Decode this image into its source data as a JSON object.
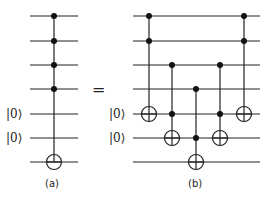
{
  "diagram": {
    "type": "quantum-circuit-identity",
    "equals_sign": "=",
    "left": {
      "caption": "(a)",
      "wires": [
        "",
        "",
        "",
        "",
        "|0⟩",
        "|0⟩",
        ""
      ],
      "gates": [
        {
          "type": "toffoli-4",
          "controls": [
            0,
            1,
            2,
            3
          ],
          "target": 6
        }
      ]
    },
    "right": {
      "caption": "(b)",
      "wires": [
        "",
        "",
        "",
        "",
        "|0⟩",
        "|0⟩",
        ""
      ],
      "gates": [
        {
          "type": "toffoli",
          "controls": [
            0,
            1
          ],
          "target": 4
        },
        {
          "type": "toffoli",
          "controls": [
            2,
            4
          ],
          "target": 5
        },
        {
          "type": "toffoli",
          "controls": [
            3,
            5
          ],
          "target": 6
        },
        {
          "type": "toffoli",
          "controls": [
            2,
            4
          ],
          "target": 5
        },
        {
          "type": "toffoli",
          "controls": [
            0,
            1
          ],
          "target": 4
        }
      ]
    },
    "ket_label": "|0⟩"
  }
}
